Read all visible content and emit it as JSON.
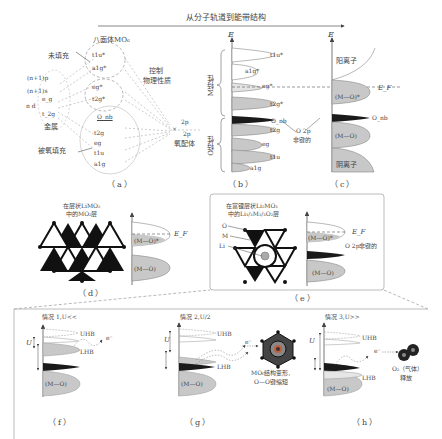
{
  "header": {
    "title": "从分子轨道到能带结构",
    "top_right_text": "（部分文字被裁切）"
  },
  "panel_a": {
    "label": "（a）",
    "octahedral_title": "八面体MO₆",
    "unfilled": "未填充",
    "control_props_line1": "控制",
    "control_props_line2": "物理性质",
    "metal_levels": [
      "(n+1)p",
      "(n+1)s",
      "e_g",
      "n d",
      "t_2g"
    ],
    "metal_label": "金属",
    "oxygen_filled": "被氧填充",
    "mo_levels_upper": [
      "t1u*",
      "a1g*",
      "eg*",
      "t2g*"
    ],
    "o_nb": "O_nb",
    "mo_levels_lower": [
      "t2g",
      "eg",
      "t1u",
      "a1g"
    ],
    "ligand_2p_1": "2p",
    "ligand_2p_2": "2p",
    "ligand_label": "氧配体"
  },
  "panel_b": {
    "label": "（b）",
    "axis": "E",
    "m_character": "M特性",
    "o_character": "O特性",
    "bands": [
      "t1u*",
      "a1g*",
      "eg*",
      "t2g*",
      "O_nb",
      "t2g",
      "eg",
      "t1u",
      "a1g"
    ],
    "o2p_nonbond_line1": "O 2p",
    "o2p_nonbond_line2": "非键的"
  },
  "panel_c": {
    "label": "（c）",
    "axis": "E",
    "cation": "阳离子",
    "mo_antibond": "(M—O)*",
    "fermi": "E_F",
    "o_nb": "O_nb",
    "mo_bond": "(M—O)",
    "anion": "阴离子"
  },
  "panel_d": {
    "label": "（d）",
    "caption_line1": "在层状LiMO₂",
    "caption_line2": "中的MO₂层",
    "mo_antibond": "(M—O)*",
    "fermi": "E_F",
    "mo_bond": "(M—O)"
  },
  "panel_e": {
    "label": "（e）",
    "caption_line1": "在富锂层状Li₂MO₃",
    "caption_line2": "中的Li₁/₃M₂/₃O₂层",
    "atom_o": "O",
    "atom_m": "M",
    "atom_li": "Li",
    "mo_antibond": "(M—O)*",
    "fermi": "E_F",
    "o2p_nonbond": "O 2p非键的",
    "mo_bond": "(M—O)"
  },
  "panel_f": {
    "label": "（f）",
    "case": "情况 1,U<<",
    "u": "U",
    "uhb": "UHB",
    "lhb": "LHB",
    "electron": "e⁻",
    "mo_bond": "(M—O)"
  },
  "panel_g": {
    "label": "（g）",
    "case": "情况 2,U/2",
    "u": "U",
    "uhb": "UHB",
    "lhb": "LHB",
    "electron": "e⁻",
    "mo_bond": "(M—O)",
    "result_line1": "MO₆结构变形,",
    "result_line2": "O—O键缩短"
  },
  "panel_h": {
    "label": "（h）",
    "case": "情况 3,U>>",
    "u": "U",
    "uhb": "UHB",
    "lhb": "LHB",
    "electron": "e⁻",
    "mo_bond": "(M—O)",
    "result_line1": "O₂（气体）",
    "result_line2": "释放"
  },
  "colors": {
    "band_fill": "#c8c8c8",
    "band_dark": "#1a1a1a",
    "line": "#666666",
    "dash": "#888888"
  }
}
